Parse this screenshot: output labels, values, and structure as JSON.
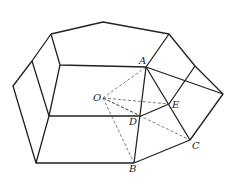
{
  "diagram": {
    "type": "geometry",
    "labels": {
      "A": "A",
      "B": "B",
      "C": "C",
      "D": "D",
      "E": "E",
      "O": "O"
    },
    "points": {
      "A": [
        146,
        67
      ],
      "B": [
        134,
        163
      ],
      "C": [
        190,
        140
      ],
      "D": [
        141,
        116
      ],
      "E": [
        169,
        104
      ],
      "O": [
        103,
        98
      ]
    }
  }
}
